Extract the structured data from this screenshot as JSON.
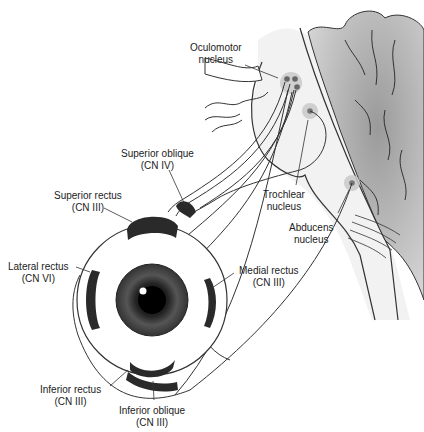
{
  "colors": {
    "line": "#333333",
    "brainstem_fill": "#f2f2f2",
    "cerebellum_fill": "#a8a8a8",
    "nucleus_halo": "#c9c9c9",
    "nucleus_core": "#777777",
    "muscle": "#2a2a2a"
  },
  "labels": {
    "oculomotor": {
      "line1": "Oculomotor",
      "line2": "nucleus"
    },
    "trochlear": {
      "line1": "Trochlear",
      "line2": "nucleus"
    },
    "abducens": {
      "line1": "Abducens",
      "line2": "nucleus"
    },
    "superior_oblique": {
      "line1": "Superior oblique",
      "line2": "(CN IV)"
    },
    "superior_rectus": {
      "line1": "Superior rectus",
      "line2": "(CN III)"
    },
    "lateral_rectus": {
      "line1": "Lateral rectus",
      "line2": "(CN VI)"
    },
    "medial_rectus": {
      "line1": "Medial rectus",
      "line2": "(CN III)"
    },
    "inferior_rectus": {
      "line1": "Inferior rectus",
      "line2": "(CN III)"
    },
    "inferior_oblique": {
      "line1": "Inferior oblique",
      "line2": "(CN III)"
    }
  }
}
